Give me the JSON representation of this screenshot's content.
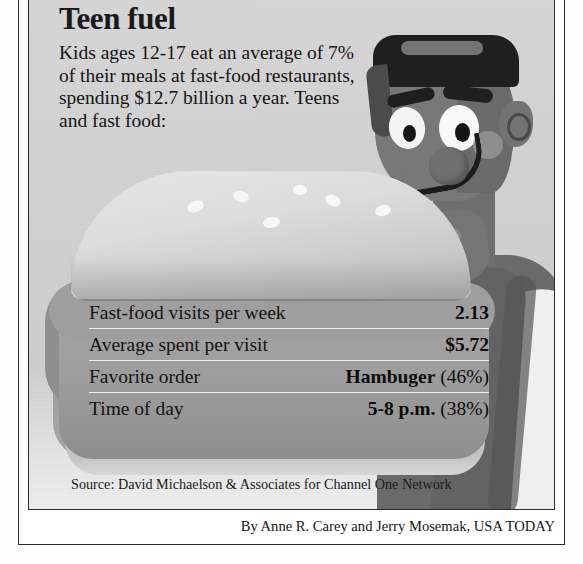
{
  "graphic": {
    "headline": "Teen fuel",
    "lede": "Kids ages 12-17 eat an average of 7% of their meals at fast-food restaurants, spending $12.7 billion a year. Teens and fast food:",
    "source": "Source: David Michaelson & Associates for Channel One Network",
    "byline": "By Anne R. Carey and Jerry Mosemak, USA TODAY"
  },
  "chart_data": {
    "type": "table",
    "title": "Teen fuel",
    "subtitle": "Kids ages 12-17 eat an average of 7% of their meals at fast-food restaurants, spending $12.7 billion a year. Teens and fast food:",
    "columns": [
      "Measure",
      "Value"
    ],
    "rows": [
      {
        "label": "Fast-food visits per week",
        "value": "2.13",
        "pct": ""
      },
      {
        "label": "Average spent per visit",
        "value": "$5.72",
        "pct": ""
      },
      {
        "label": "Favorite order",
        "value": "Hambuger",
        "pct": " (46%)"
      },
      {
        "label": "Time of day",
        "value": "5-8 p.m.",
        "pct": " (38%)"
      }
    ],
    "source": "David Michaelson & Associates for Channel One Network"
  },
  "illustration": {
    "character": "teen-boy-holding-hamburger",
    "food": "hamburger-with-sesame-seed-bun"
  },
  "colors": {
    "paper": "#d3d3d3",
    "ink": "#1a1a1a",
    "rule": "#2b2b2b",
    "divider": "#ffffff"
  }
}
